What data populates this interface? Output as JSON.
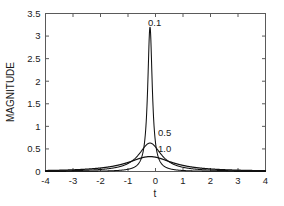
{
  "chart_data": {
    "type": "line",
    "title": "",
    "xlabel": "t",
    "ylabel": "MAGNITUDE",
    "xlim": [
      -4,
      4
    ],
    "ylim": [
      0,
      3.5
    ],
    "grid": false,
    "legend_position": "inline-annotations",
    "xticks": [
      "-4",
      "-3",
      "-2",
      "-1",
      "0",
      "1",
      "2",
      "3",
      "4"
    ],
    "xtick_values": [
      -4,
      -3,
      -2,
      -1,
      0,
      1,
      2,
      3,
      4
    ],
    "yticks": [
      "0",
      "0.5",
      "1",
      "1.5",
      "2",
      "2.5",
      "3",
      "3.5"
    ],
    "ytick_values": [
      0,
      0.5,
      1,
      1.5,
      2,
      2.5,
      3,
      3.5
    ],
    "peak_center": -0.2,
    "series": [
      {
        "name": "0.1",
        "label": "0.1",
        "annotation": "0.1",
        "peak_value": 3.2,
        "half_width": 0.1,
        "color": "#111111",
        "x": [
          -4,
          -3.5,
          -3,
          -2.5,
          -2,
          -1.5,
          -1.2,
          -1,
          -0.8,
          -0.6,
          -0.5,
          -0.4,
          -0.35,
          -0.3,
          -0.27,
          -0.25,
          -0.23,
          -0.21,
          -0.2,
          -0.19,
          -0.17,
          -0.15,
          -0.13,
          -0.1,
          -0.05,
          0,
          0.1,
          0.2,
          0.4,
          0.6,
          0.8,
          1,
          1.5,
          2,
          2.5,
          3,
          3.5,
          4
        ],
        "y": [
          0.008,
          0.01,
          0.012,
          0.015,
          0.02,
          0.03,
          0.04,
          0.05,
          0.07,
          0.12,
          0.18,
          0.33,
          0.48,
          0.8,
          1.2,
          1.75,
          2.5,
          3.1,
          3.2,
          3.1,
          2.4,
          1.6,
          1.05,
          0.55,
          0.26,
          0.16,
          0.08,
          0.05,
          0.028,
          0.02,
          0.015,
          0.012,
          0.008,
          0.006,
          0.005,
          0.004,
          0.003,
          0.003
        ]
      },
      {
        "name": "0.5",
        "label": "0.5",
        "annotation": "0.5",
        "peak_value": 0.63,
        "half_width": 0.5,
        "color": "#111111",
        "x": [
          -4,
          -3.5,
          -3,
          -2.5,
          -2,
          -1.6,
          -1.3,
          -1.1,
          -0.95,
          -0.8,
          -0.7,
          -0.6,
          -0.5,
          -0.42,
          -0.35,
          -0.3,
          -0.25,
          -0.2,
          -0.15,
          -0.1,
          -0.05,
          0,
          0.1,
          0.2,
          0.35,
          0.5,
          0.7,
          0.9,
          1.2,
          1.5,
          2,
          2.5,
          3,
          3.5,
          4
        ],
        "y": [
          0.012,
          0.015,
          0.02,
          0.026,
          0.036,
          0.05,
          0.07,
          0.09,
          0.115,
          0.15,
          0.19,
          0.25,
          0.33,
          0.42,
          0.51,
          0.57,
          0.61,
          0.63,
          0.61,
          0.57,
          0.51,
          0.44,
          0.33,
          0.25,
          0.17,
          0.12,
          0.08,
          0.058,
          0.038,
          0.028,
          0.018,
          0.013,
          0.01,
          0.008,
          0.007
        ]
      },
      {
        "name": "1.0",
        "label": "1.0",
        "annotation": "1.0",
        "peak_value": 0.33,
        "half_width": 1.0,
        "color": "#111111",
        "x": [
          -4,
          -3.5,
          -3,
          -2.6,
          -2.2,
          -1.9,
          -1.6,
          -1.4,
          -1.2,
          -1,
          -0.85,
          -0.7,
          -0.55,
          -0.45,
          -0.35,
          -0.28,
          -0.2,
          -0.12,
          -0.05,
          0.05,
          0.15,
          0.3,
          0.45,
          0.6,
          0.8,
          1,
          1.3,
          1.6,
          2,
          2.4,
          2.8,
          3.2,
          3.6,
          4
        ],
        "y": [
          0.022,
          0.027,
          0.034,
          0.041,
          0.05,
          0.06,
          0.073,
          0.085,
          0.1,
          0.122,
          0.145,
          0.175,
          0.215,
          0.25,
          0.285,
          0.305,
          0.33,
          0.32,
          0.3,
          0.27,
          0.24,
          0.195,
          0.16,
          0.135,
          0.105,
          0.085,
          0.062,
          0.048,
          0.035,
          0.027,
          0.021,
          0.017,
          0.014,
          0.012
        ]
      }
    ],
    "annotations": [
      {
        "text": "0.1",
        "x_px": 148,
        "y_px": 26
      },
      {
        "text": "0.5",
        "x_px": 158,
        "y_px": 136
      },
      {
        "text": "1.0",
        "x_px": 158,
        "y_px": 152
      }
    ]
  },
  "axes": {
    "frame_color": "#5a5a5a",
    "curve_color": "#111111",
    "background": "#ffffff"
  }
}
